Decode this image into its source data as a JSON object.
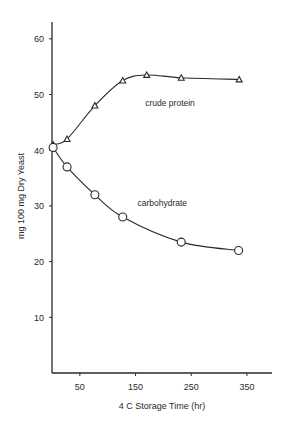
{
  "chart_data": {
    "type": "line",
    "title": "",
    "xlabel": "4 C Storage Time (hr)",
    "ylabel": "mg 100 mg Dry Yeast",
    "xlim": [
      0,
      390
    ],
    "ylim": [
      0,
      63
    ],
    "x_ticks": [
      50,
      150,
      250,
      350
    ],
    "y_ticks": [
      10,
      20,
      30,
      40,
      50,
      60
    ],
    "grid": false,
    "legend": "inline labels",
    "series": [
      {
        "name": "crude protein",
        "marker": "triangle",
        "x": [
          2,
          27,
          77,
          127,
          170,
          232,
          336
        ],
        "values": [
          41,
          42,
          48,
          52.5,
          53.5,
          53,
          52.7
        ]
      },
      {
        "name": "carbohydrate",
        "marker": "circle",
        "x": [
          2,
          27,
          77,
          127,
          232,
          335
        ],
        "values": [
          40.5,
          37,
          32,
          28,
          23.5,
          22
        ]
      }
    ],
    "annotations": [
      {
        "text": "crude protein",
        "x": 232,
        "y": 48.5
      },
      {
        "text": "carbohydrate",
        "x": 218,
        "y": 30.5
      }
    ]
  },
  "colors": {
    "ink": "#2a2a2a",
    "background": "#ffffff"
  }
}
